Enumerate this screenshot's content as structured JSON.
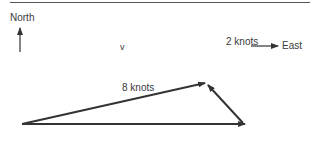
{
  "diagram": {
    "labels": {
      "north": "North",
      "east": "East",
      "velocity": "v",
      "boat_speed": "8 knots",
      "current_speed": "2 knots"
    },
    "vectors": [
      {
        "name": "resultant-v",
        "from": [
          22,
          124
        ],
        "to": [
          205,
          83
        ]
      },
      {
        "name": "boat-8-knots",
        "from": [
          22,
          124
        ],
        "to": [
          245,
          124
        ]
      },
      {
        "name": "current-2-knots",
        "from": [
          242,
          122
        ],
        "to": [
          207,
          84
        ]
      }
    ],
    "colors": {
      "stroke": "#333333",
      "text": "#3a3a3a"
    }
  }
}
